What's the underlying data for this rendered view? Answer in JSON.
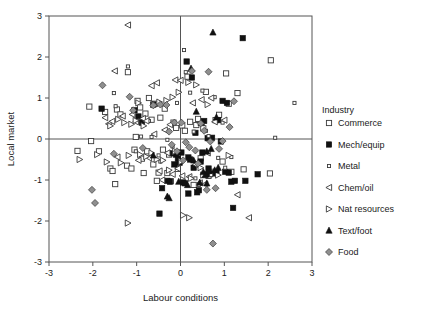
{
  "chart_data": {
    "type": "scatter",
    "title": "",
    "xlabel": "Labour conditions",
    "ylabel": "Local market",
    "xlim": [
      -3,
      3
    ],
    "ylim": [
      -3,
      3
    ],
    "xticks": [
      "-3",
      "-2",
      "-1",
      "0",
      "1",
      "2",
      "3"
    ],
    "yticks": [
      "-3",
      "-2",
      "-1",
      "0",
      "1",
      "2",
      "3"
    ],
    "xtick_values": [
      -3,
      -2,
      -1,
      0,
      1,
      2,
      3
    ],
    "ytick_values": [
      -3,
      -2,
      -1,
      0,
      1,
      2,
      3
    ],
    "grid": false,
    "zero_lines": true,
    "legend_position": "right",
    "legend_title": "Industry",
    "series": [
      {
        "name": "Commerce",
        "marker": "open-square",
        "points": [
          [
            -2.35,
            -0.29
          ],
          [
            -2.08,
            0.79
          ],
          [
            -2.04,
            -0.05
          ],
          [
            -1.86,
            -0.3
          ],
          [
            -1.72,
            0.66
          ],
          [
            -1.6,
            -0.72
          ],
          [
            -1.55,
            -0.78
          ],
          [
            -1.49,
            -1.1
          ],
          [
            -1.45,
            0.72
          ],
          [
            -1.37,
            0.6
          ],
          [
            -1.22,
            -0.65
          ],
          [
            -1.2,
            1.63
          ],
          [
            -1.12,
            -0.72
          ],
          [
            -1.05,
            -0.26
          ],
          [
            -1.02,
            0.05
          ],
          [
            -0.98,
            0.93
          ],
          [
            -0.92,
            0.77
          ],
          [
            -0.88,
            -0.48
          ],
          [
            -0.84,
            -0.83
          ],
          [
            -0.8,
            0.62
          ],
          [
            -0.76,
            -0.3
          ],
          [
            -0.72,
            1.0
          ],
          [
            -0.66,
            0.47
          ],
          [
            -0.62,
            -0.62
          ],
          [
            -0.58,
            0.86
          ],
          [
            -0.54,
            -1.02
          ],
          [
            -0.5,
            -0.82
          ],
          [
            -0.46,
            0.52
          ],
          [
            -0.4,
            -0.26
          ],
          [
            -0.36,
            0.74
          ],
          [
            -0.3,
            -0.83
          ],
          [
            -0.26,
            -0.38
          ],
          [
            -0.22,
            -1.03
          ],
          [
            -0.16,
            0.4
          ],
          [
            -0.1,
            0.27
          ],
          [
            -0.06,
            -0.73
          ],
          [
            0.04,
            0.33
          ],
          [
            0.1,
            0.2
          ],
          [
            0.16,
            1.52
          ],
          [
            0.22,
            0.42
          ],
          [
            0.3,
            -1.12
          ],
          [
            0.36,
            0.34
          ],
          [
            0.4,
            0.49
          ],
          [
            0.46,
            -0.47
          ],
          [
            0.52,
            0.26
          ],
          [
            0.58,
            1.15
          ],
          [
            0.64,
            -0.9
          ],
          [
            0.72,
            -0.8
          ],
          [
            0.8,
            0.46
          ],
          [
            0.88,
            0.59
          ],
          [
            0.96,
            -0.55
          ],
          [
            1.04,
            1.6
          ],
          [
            1.1,
            0.86
          ],
          [
            1.16,
            -0.8
          ],
          [
            1.3,
            1.12
          ],
          [
            1.44,
            -0.74
          ],
          [
            2.04,
            -0.84
          ],
          [
            2.06,
            1.92
          ]
        ]
      },
      {
        "name": "Mech/equip",
        "marker": "filled-square",
        "points": [
          [
            -1.8,
            0.74
          ],
          [
            -1.05,
            0.7
          ],
          [
            -0.96,
            0.55
          ],
          [
            -0.88,
            0.4
          ],
          [
            -0.62,
            0.84
          ],
          [
            -0.48,
            -1.82
          ],
          [
            -0.3,
            -1.02
          ],
          [
            -0.24,
            -1.04
          ],
          [
            -0.18,
            -0.35
          ],
          [
            -0.14,
            -0.62
          ],
          [
            -0.1,
            -0.38
          ],
          [
            -0.06,
            -0.48
          ],
          [
            -0.02,
            -0.58
          ],
          [
            0.02,
            -0.33
          ],
          [
            0.06,
            -1.06
          ],
          [
            0.1,
            -1.08
          ],
          [
            0.14,
            1.89
          ],
          [
            0.18,
            -0.45
          ],
          [
            0.22,
            -0.5
          ],
          [
            0.26,
            1.5
          ],
          [
            0.3,
            -0.7
          ],
          [
            0.34,
            0.15
          ],
          [
            0.38,
            -1.3
          ],
          [
            0.42,
            -1.25
          ],
          [
            0.46,
            -0.55
          ],
          [
            0.5,
            -0.33
          ],
          [
            0.54,
            0.44
          ],
          [
            0.58,
            -0.86
          ],
          [
            0.62,
            0.02
          ],
          [
            0.66,
            -0.86
          ],
          [
            0.72,
            0.03
          ],
          [
            0.76,
            -0.84
          ],
          [
            0.82,
            -0.8
          ],
          [
            0.86,
            0.46
          ],
          [
            0.92,
            -0.06
          ],
          [
            0.96,
            0.93
          ],
          [
            1.02,
            -0.8
          ],
          [
            1.06,
            0.88
          ],
          [
            1.1,
            -0.82
          ],
          [
            1.16,
            -1.04
          ],
          [
            1.2,
            -1.68
          ],
          [
            1.24,
            -1.02
          ],
          [
            1.42,
            2.46
          ],
          [
            1.48,
            -1.02
          ],
          [
            1.76,
            -0.86
          ],
          [
            -0.42,
            -1.2
          ],
          [
            0.18,
            -1.33
          ],
          [
            0.64,
            -0.72
          ]
        ]
      },
      {
        "name": "Metal",
        "marker": "small-open-square",
        "points": [
          [
            -1.52,
            1.12
          ],
          [
            -1.48,
            0.8
          ],
          [
            -1.2,
            1.77
          ],
          [
            -1.02,
            -0.3
          ],
          [
            -0.9,
            0.06
          ],
          [
            -0.72,
            0.44
          ],
          [
            -0.66,
            0.05
          ],
          [
            -0.5,
            -0.4
          ],
          [
            -0.46,
            -0.55
          ],
          [
            -0.3,
            -0.02
          ],
          [
            -0.18,
            -0.18
          ],
          [
            0.08,
            2.17
          ],
          [
            0.12,
            1.63
          ],
          [
            0.22,
            1.13
          ],
          [
            0.3,
            0.18
          ],
          [
            0.44,
            0.37
          ],
          [
            0.5,
            1.18
          ],
          [
            0.58,
            0.2
          ],
          [
            0.64,
            0.07
          ],
          [
            0.7,
            -0.88
          ],
          [
            0.78,
            1.02
          ],
          [
            0.86,
            -0.46
          ],
          [
            0.96,
            0.4
          ],
          [
            1.02,
            -0.7
          ],
          [
            1.16,
            -0.44
          ],
          [
            2.16,
            0.03
          ],
          [
            2.6,
            0.88
          ],
          [
            0.34,
            -0.96
          ],
          [
            -0.08,
            0.88
          ],
          [
            0.42,
            -1.12
          ]
        ]
      },
      {
        "name": "Chem/oil",
        "marker": "left-triangle",
        "points": [
          [
            -1.72,
            0.52
          ],
          [
            -1.64,
            0.37
          ],
          [
            -1.56,
            0.43
          ],
          [
            -1.5,
            1.66
          ],
          [
            -1.44,
            -0.44
          ],
          [
            -1.2,
            2.78
          ],
          [
            -1.1,
            0.6
          ],
          [
            -1.02,
            0.42
          ],
          [
            -0.96,
            -0.52
          ],
          [
            -0.86,
            0.5
          ],
          [
            -0.78,
            0.44
          ],
          [
            -0.72,
            -0.46
          ],
          [
            -0.66,
            1.3
          ],
          [
            -0.6,
            0.12
          ],
          [
            -0.54,
            1.37
          ],
          [
            -0.48,
            -0.78
          ],
          [
            -0.42,
            -1.0
          ],
          [
            -0.36,
            0.22
          ],
          [
            -0.3,
            -0.34
          ],
          [
            -0.24,
            0.35
          ],
          [
            -0.18,
            -0.86
          ],
          [
            -0.12,
            1.44
          ],
          [
            -0.06,
            -0.72
          ],
          [
            0.0,
            1.43
          ],
          [
            0.04,
            -0.9
          ],
          [
            0.2,
            -0.92
          ],
          [
            0.34,
            -0.62
          ],
          [
            0.48,
            0.96
          ],
          [
            0.56,
            -1.1
          ],
          [
            0.62,
            -0.34
          ],
          [
            0.7,
            1.0
          ],
          [
            0.78,
            0.42
          ],
          [
            1.0,
            0.46
          ],
          [
            1.3,
            -1.36
          ],
          [
            1.56,
            -1.92
          ],
          [
            -1.32,
            0.56
          ],
          [
            0.28,
            0.88
          ],
          [
            0.44,
            -1.07
          ]
        ]
      },
      {
        "name": "Nat  resources",
        "marker": "right-triangle",
        "points": [
          [
            -2.3,
            -0.5
          ],
          [
            -1.9,
            -0.38
          ],
          [
            -1.68,
            -0.56
          ],
          [
            -1.6,
            0.32
          ],
          [
            -1.42,
            0.48
          ],
          [
            -1.36,
            -0.58
          ],
          [
            -1.28,
            0.4
          ],
          [
            -1.18,
            -0.4
          ],
          [
            -1.12,
            0.36
          ],
          [
            -1.02,
            0.45
          ],
          [
            -0.92,
            -0.38
          ],
          [
            -0.84,
            0.32
          ],
          [
            -0.78,
            -0.43
          ],
          [
            -0.66,
            -0.34
          ],
          [
            -0.6,
            0.84
          ],
          [
            -0.54,
            -0.5
          ],
          [
            -0.48,
            0.9
          ],
          [
            -0.4,
            -0.52
          ],
          [
            -0.32,
            0.94
          ],
          [
            -0.26,
            -0.76
          ],
          [
            -0.18,
            1.02
          ],
          [
            -0.12,
            -0.3
          ],
          [
            -0.04,
            1.14
          ],
          [
            0.02,
            -0.55
          ],
          [
            0.06,
            -1.86
          ],
          [
            0.18,
            1.38
          ],
          [
            0.24,
            -0.96
          ],
          [
            0.36,
            1.32
          ],
          [
            0.46,
            -0.7
          ],
          [
            0.62,
            0.84
          ],
          [
            0.86,
            -0.88
          ],
          [
            1.1,
            -0.4
          ],
          [
            -1.2,
            -2.05
          ],
          [
            0.2,
            -1.92
          ],
          [
            -0.96,
            0.88
          ],
          [
            0.52,
            -0.88
          ]
        ]
      },
      {
        "name": "Text/foot",
        "marker": "filled-triangle",
        "points": [
          [
            -0.62,
            -0.4
          ],
          [
            -0.3,
            -1.4
          ],
          [
            -0.26,
            -1.44
          ],
          [
            0.24,
            1.72
          ],
          [
            0.36,
            0.67
          ],
          [
            0.44,
            -1.06
          ],
          [
            0.52,
            -0.8
          ],
          [
            0.56,
            -0.88
          ],
          [
            0.6,
            -0.3
          ],
          [
            0.64,
            -0.78
          ],
          [
            0.7,
            -0.24
          ],
          [
            0.74,
            2.6
          ],
          [
            0.78,
            -0.76
          ],
          [
            0.82,
            0.53
          ],
          [
            0.86,
            -0.7
          ],
          [
            0.6,
            -1.08
          ],
          [
            0.3,
            -0.52
          ],
          [
            0.48,
            0.4
          ],
          [
            0.16,
            -1.12
          ],
          [
            -0.04,
            -1.04
          ]
        ]
      },
      {
        "name": "Food",
        "marker": "gray-diamond",
        "points": [
          [
            -2.02,
            -1.24
          ],
          [
            -1.95,
            -1.56
          ],
          [
            -1.78,
            1.31
          ],
          [
            -1.52,
            -0.36
          ],
          [
            -1.16,
            1.03
          ],
          [
            -1.08,
            0.7
          ],
          [
            -0.86,
            -0.22
          ],
          [
            -0.62,
            0.82
          ],
          [
            -0.46,
            0.84
          ],
          [
            -0.26,
            0.18
          ],
          [
            -0.2,
            -0.14
          ],
          [
            -0.14,
            0.4
          ],
          [
            -0.08,
            -0.3
          ],
          [
            0.02,
            0.4
          ],
          [
            0.06,
            -0.52
          ],
          [
            0.2,
            -0.2
          ],
          [
            0.26,
            1.66
          ],
          [
            0.34,
            -0.28
          ],
          [
            0.4,
            -0.6
          ],
          [
            0.46,
            0.38
          ],
          [
            0.54,
            0.2
          ],
          [
            0.6,
            -1.24
          ],
          [
            0.68,
            -0.06
          ],
          [
            0.74,
            -2.55
          ],
          [
            0.8,
            -1.2
          ],
          [
            0.88,
            -0.24
          ],
          [
            0.96,
            -0.05
          ],
          [
            1.12,
            0.29
          ],
          [
            1.22,
            0.92
          ],
          [
            -0.32,
            0.83
          ],
          [
            0.12,
            -0.08
          ],
          [
            0.64,
            1.64
          ]
        ]
      }
    ]
  },
  "legend": {
    "title": "Industry",
    "items": [
      {
        "label": "Commerce",
        "marker": "open-square"
      },
      {
        "label": "Mech/equip",
        "marker": "filled-square"
      },
      {
        "label": "Metal",
        "marker": "small-open-square"
      },
      {
        "label": "Chem/oil",
        "marker": "left-triangle"
      },
      {
        "label": "Nat  resources",
        "marker": "right-triangle"
      },
      {
        "label": "Text/foot",
        "marker": "filled-triangle"
      },
      {
        "label": "Food",
        "marker": "gray-diamond"
      }
    ]
  },
  "colors": {
    "axis": "#555555",
    "marker_outline": "#3a3a3a",
    "marker_fill_dark": "#111111",
    "marker_fill_gray": "#8f8f8f",
    "background": "#ffffff"
  }
}
